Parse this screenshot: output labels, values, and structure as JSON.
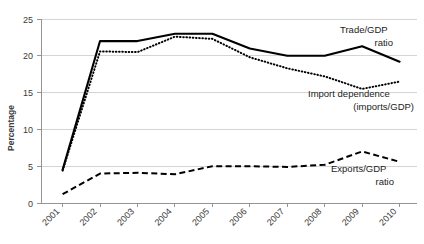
{
  "chart_data": {
    "type": "line",
    "title": "",
    "xlabel": "",
    "ylabel": "Percentage",
    "categories": [
      "2001",
      "2002",
      "2003",
      "2004",
      "2005",
      "2006",
      "2007",
      "2008",
      "2009",
      "2010"
    ],
    "ylim": [
      0,
      25
    ],
    "yticks": [
      0,
      5,
      10,
      15,
      20,
      25
    ],
    "ytick_labels": [
      "0",
      "5",
      "10",
      "15",
      "20",
      "25"
    ],
    "grid": "horizontal",
    "legend_position": "inline-annotations",
    "series": [
      {
        "name": "Trade/GDP ratio",
        "style": "solid",
        "values": [
          4.5,
          22.0,
          22.0,
          23.0,
          23.0,
          21.0,
          20.0,
          20.0,
          21.3,
          19.2
        ]
      },
      {
        "name": "Import dependence (imports/GDP)",
        "style": "dotted",
        "values": [
          4.4,
          20.6,
          20.5,
          22.6,
          22.3,
          19.8,
          18.3,
          17.2,
          15.5,
          16.5
        ]
      },
      {
        "name": "Exports/GDP ratio",
        "style": "dashed",
        "values": [
          1.2,
          4.0,
          4.1,
          3.9,
          5.0,
          5.0,
          4.9,
          5.2,
          7.0,
          5.6
        ]
      }
    ],
    "annotations": [
      {
        "id": "trade",
        "line1": "Trade/GDP",
        "line2": "ratio"
      },
      {
        "id": "import",
        "line1": "Import dependence",
        "line2": "(imports/GDP)"
      },
      {
        "id": "exports",
        "line1": "Exports/GDP",
        "line2": "ratio"
      }
    ]
  },
  "ytick_0": "0",
  "ytick_1": "5",
  "ytick_2": "10",
  "ytick_3": "15",
  "ytick_4": "20",
  "ytick_5": "25",
  "xtick_0": "2001",
  "xtick_1": "2002",
  "xtick_2": "2003",
  "xtick_3": "2004",
  "xtick_4": "2005",
  "xtick_5": "2006",
  "xtick_6": "2007",
  "xtick_7": "2008",
  "xtick_8": "2009",
  "xtick_9": "2010",
  "yaxis_title": "Percentage",
  "ann_trade_1": "Trade/GDP",
  "ann_trade_2": "ratio",
  "ann_import_1": "Import dependence",
  "ann_import_2": "(imports/GDP)",
  "ann_exports_1": "Exports/GDP",
  "ann_exports_2": "ratio"
}
